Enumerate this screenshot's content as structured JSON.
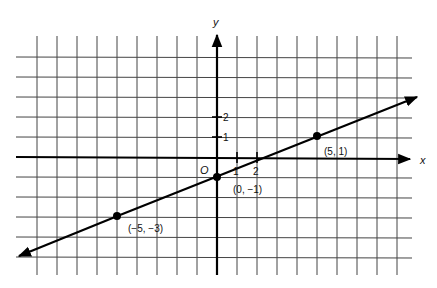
{
  "chart_data": {
    "type": "line",
    "title": "",
    "xlabel": "x",
    "ylabel": "y",
    "origin_label": "O",
    "grid": true,
    "xlim": [
      -10,
      9.5
    ],
    "ylim": [
      -5,
      6
    ],
    "x_tick_labels": [
      "1",
      "2"
    ],
    "y_tick_labels": [
      "1",
      "2"
    ],
    "line": {
      "equation": "y = (2/5)x - 1",
      "slope": 0.4,
      "intercept": -1,
      "arrows_both_ends": true
    },
    "points": [
      {
        "x": 5,
        "y": 1,
        "label": "(5, 1)"
      },
      {
        "x": 0,
        "y": -1,
        "label": "(0, −1)"
      },
      {
        "x": -5,
        "y": -3,
        "label": "(−5, −3)"
      }
    ]
  },
  "colors": {
    "grid": "#333333",
    "axis": "#000000",
    "line": "#000000",
    "background": "#ffffff"
  }
}
